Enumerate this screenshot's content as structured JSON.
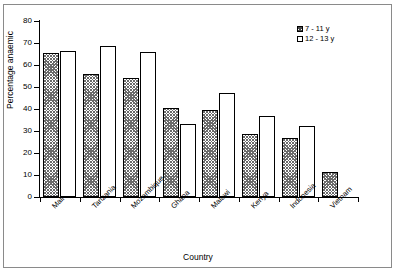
{
  "chart_data": {
    "type": "bar",
    "title": "",
    "xlabel": "Country",
    "ylabel": "Percentage anaemic",
    "ylim": [
      0,
      80
    ],
    "yticks": [
      0,
      10,
      20,
      30,
      40,
      50,
      60,
      70,
      80
    ],
    "grid": false,
    "legend_position": "top-right",
    "categories": [
      "Mali",
      "Tanzania",
      "Mozambique",
      "Ghana",
      "Malawi",
      "Kenya",
      "Indonesia",
      "Vietnam"
    ],
    "series": [
      {
        "name": "7 - 11 y",
        "fill": "hatched-grey",
        "values": [
          65.5,
          56.0,
          54.0,
          40.5,
          39.5,
          28.5,
          27.0,
          11.5
        ]
      },
      {
        "name": "12 - 13 y",
        "fill": "white",
        "values": [
          66.5,
          68.5,
          66.0,
          33.0,
          47.5,
          37.0,
          32.5,
          null
        ]
      }
    ]
  },
  "axes": {
    "y_tick_labels": [
      "0",
      "10",
      "20",
      "30",
      "40",
      "50",
      "60",
      "70",
      "80"
    ],
    "y_title": "Percentage anaemic",
    "x_title": "Country"
  },
  "legend": {
    "entries": [
      {
        "label": "7 - 11 y"
      },
      {
        "label": "12 - 13 y"
      }
    ]
  },
  "colors": {
    "axis": "#000000",
    "frame": "#8a8a8a",
    "background": "#ffffff",
    "bar_hatch": "#6b6b6b",
    "bar_outline": "#000000"
  }
}
